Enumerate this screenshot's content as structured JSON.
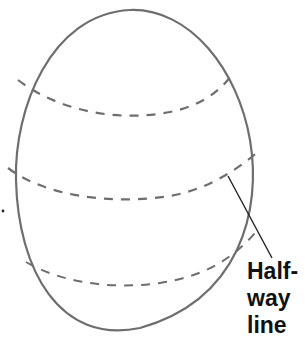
{
  "diagram": {
    "label_lines": [
      "Half-",
      "way",
      "line"
    ],
    "colors": {
      "outline": "#6e6e6e",
      "dashes": "#6e6e6e",
      "pointer": "#222222",
      "text": "#111111",
      "background": "#ffffff"
    },
    "shapes": {
      "egg": "oval outline, wider at bottom",
      "guide_lines": [
        "upper dashed curve",
        "middle dashed curve (half-way line)",
        "lower dashed curve"
      ]
    }
  }
}
